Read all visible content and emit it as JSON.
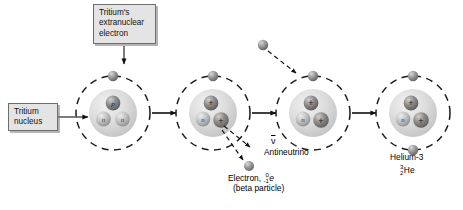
{
  "diagram": {
    "background": "#ffffff"
  },
  "callouts": [
    {
      "id": "extranuclear",
      "text": "Tritium's\nextranuclear\nelectron",
      "fill": "#e4e4e4",
      "border": "#6d6d6d"
    },
    {
      "id": "nucleus",
      "text": "Tritium\nnucleus",
      "fill": "#e4e4e4",
      "border": "#6d6d6d"
    }
  ],
  "labels": {
    "antineutrino_symbol": "ν",
    "antineutrino": "Antineutrino",
    "electron_line1_prefix": "Electron, ",
    "electron_charge": "-1",
    "electron_mass": "0",
    "electron_symbol": "e",
    "electron_line2": "(beta particle)",
    "helium_name": "Helium-3",
    "helium_mass": "3",
    "helium_number": "2",
    "helium_symbol": "He"
  },
  "particles": {
    "proton_glyph": "p",
    "proton_plus_glyph": "+",
    "neutron_glyph": "n",
    "proton_color": "#8e8e8e",
    "neutron_color": "#b9b9b9",
    "electron_color": "#9a9a9a",
    "nucleus_halo": "#d6d6d6",
    "orbit_color": "#1c1c1c",
    "arrow_color": "#111111"
  },
  "stages": [
    {
      "index": 1,
      "name": "tritium-atom",
      "protons": 1,
      "neutrons": 2,
      "orbital_electrons": 1,
      "nucleus_labels": [
        "p",
        "n",
        "n"
      ]
    },
    {
      "index": 2,
      "name": "decaying-nucleus",
      "protons": 2,
      "neutrons": 1,
      "orbital_electrons": 1,
      "nucleus_labels": [
        "+",
        "n",
        "+"
      ],
      "emits": [
        "antineutrino",
        "electron"
      ]
    },
    {
      "index": 3,
      "name": "helium-3-ion",
      "protons": 2,
      "neutrons": 1,
      "orbital_electrons": 1,
      "nucleus_labels": [
        "+",
        "n",
        "+"
      ],
      "captures": "free electron"
    },
    {
      "index": 4,
      "name": "helium-3-atom",
      "protons": 2,
      "neutrons": 1,
      "orbital_electrons": 2,
      "nucleus_labels": [
        "+",
        "n",
        "+"
      ]
    }
  ]
}
